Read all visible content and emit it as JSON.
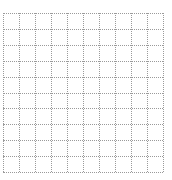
{
  "grid": {
    "columns": 10,
    "rows": 10,
    "cell_width": 16,
    "cell_height": 15.9,
    "line_color": "#9a9a9a",
    "line_style": "dotted",
    "background": "#ffffff"
  }
}
